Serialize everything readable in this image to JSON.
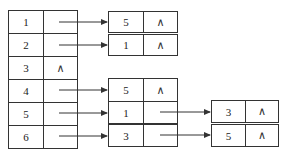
{
  "vertex_table": [
    {
      "vertex": "1",
      "pointer": "arrow"
    },
    {
      "vertex": "2",
      "pointer": "arrow"
    },
    {
      "vertex": "3",
      "pointer": "null",
      "null_symbol": "∧"
    },
    {
      "vertex": "4",
      "pointer": "arrow"
    },
    {
      "vertex": "5",
      "pointer": "arrow"
    },
    {
      "vertex": "6",
      "pointer": "arrow"
    }
  ],
  "lists": {
    "v1": [
      {
        "value": "5",
        "next": "∧"
      }
    ],
    "v2": [
      {
        "value": "1",
        "next": "∧"
      }
    ],
    "v4": [
      {
        "value": "5",
        "next": "∧"
      }
    ],
    "v5": [
      {
        "value": "1",
        "next": "arrow"
      },
      {
        "value": "3",
        "next": "∧"
      }
    ],
    "v6": [
      {
        "value": "3",
        "next": "arrow"
      },
      {
        "value": "5",
        "next": "∧"
      }
    ]
  },
  "colors": {
    "line": "#333333",
    "background": "#ffffff"
  }
}
